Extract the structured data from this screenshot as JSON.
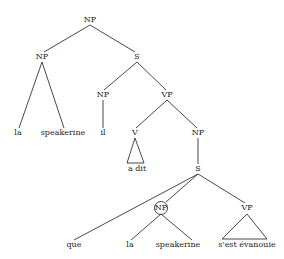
{
  "diagram": {
    "type": "syntax-tree",
    "nodes": [
      {
        "id": "np_root",
        "label": "NP",
        "x": 90,
        "y": 20
      },
      {
        "id": "np_left",
        "label": "NP",
        "x": 42,
        "y": 57
      },
      {
        "id": "s_main",
        "label": "S",
        "x": 137,
        "y": 57
      },
      {
        "id": "w_la1",
        "label": "la",
        "x": 18,
        "y": 133
      },
      {
        "id": "w_speakerine1",
        "label": "speakerine",
        "x": 63,
        "y": 133
      },
      {
        "id": "np_il",
        "label": "NP",
        "x": 103,
        "y": 95
      },
      {
        "id": "w_il",
        "label": "il",
        "x": 103,
        "y": 133
      },
      {
        "id": "vp_main",
        "label": "VP",
        "x": 167,
        "y": 95
      },
      {
        "id": "v",
        "label": "V",
        "x": 135,
        "y": 133
      },
      {
        "id": "w_adit",
        "label": "a dit",
        "x": 137,
        "y": 169
      },
      {
        "id": "np_comp",
        "label": "NP",
        "x": 198,
        "y": 133
      },
      {
        "id": "s_sub",
        "label": "S",
        "x": 198,
        "y": 169
      },
      {
        "id": "np_circled",
        "label": "NP",
        "x": 161,
        "y": 208
      },
      {
        "id": "vp_sub",
        "label": "VP",
        "x": 247,
        "y": 208
      },
      {
        "id": "w_que",
        "label": "que",
        "x": 74,
        "y": 245
      },
      {
        "id": "w_la2",
        "label": "la",
        "x": 130,
        "y": 245
      },
      {
        "id": "w_speakerine2",
        "label": "speakerine",
        "x": 178,
        "y": 245
      },
      {
        "id": "w_sestevanouie",
        "label": "s'est évanouie",
        "x": 247,
        "y": 245
      }
    ],
    "edges": [
      {
        "x1": 90,
        "y1": 25,
        "x2": 44,
        "y2": 52
      },
      {
        "x1": 90,
        "y1": 25,
        "x2": 135,
        "y2": 52
      },
      {
        "x1": 42,
        "y1": 62,
        "x2": 19,
        "y2": 128
      },
      {
        "x1": 42,
        "y1": 62,
        "x2": 64,
        "y2": 128
      },
      {
        "x1": 137,
        "y1": 62,
        "x2": 104,
        "y2": 90
      },
      {
        "x1": 137,
        "y1": 62,
        "x2": 166,
        "y2": 90
      },
      {
        "x1": 103,
        "y1": 100,
        "x2": 103,
        "y2": 128
      },
      {
        "x1": 167,
        "y1": 100,
        "x2": 136,
        "y2": 128
      },
      {
        "x1": 167,
        "y1": 100,
        "x2": 197,
        "y2": 128
      },
      {
        "x1": 198,
        "y1": 138,
        "x2": 198,
        "y2": 164
      },
      {
        "x1": 198,
        "y1": 174,
        "x2": 74,
        "y2": 240
      },
      {
        "x1": 198,
        "y1": 174,
        "x2": 166,
        "y2": 202
      },
      {
        "x1": 198,
        "y1": 174,
        "x2": 245,
        "y2": 203
      },
      {
        "x1": 161,
        "y1": 214,
        "x2": 131,
        "y2": 240
      },
      {
        "x1": 161,
        "y1": 214,
        "x2": 192,
        "y2": 240
      }
    ],
    "triangles": [
      {
        "apex": [
          135,
          138
        ],
        "left": [
          127,
          163
        ],
        "right": [
          144,
          163
        ]
      },
      {
        "apex": [
          247,
          214
        ],
        "left": [
          222,
          239
        ],
        "right": [
          267,
          239
        ]
      }
    ],
    "circle": {
      "cx": 161,
      "cy": 208,
      "r": 6.5
    }
  }
}
